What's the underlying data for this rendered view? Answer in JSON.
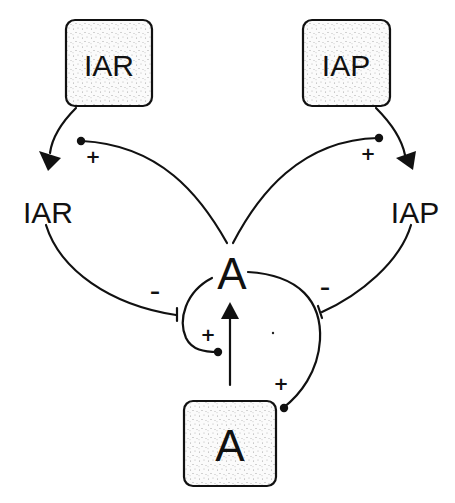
{
  "diagram": {
    "boxes": {
      "iar_source": {
        "label": "IAR"
      },
      "iap_source": {
        "label": "IAP"
      },
      "a_source": {
        "label": "A"
      }
    },
    "nodes": {
      "iar": {
        "label": "IAR"
      },
      "iap": {
        "label": "IAP"
      },
      "a": {
        "label": "A"
      }
    },
    "signs": {
      "a_to_iar": "+",
      "a_to_iap": "+",
      "iar_to_a": "–",
      "iap_to_a": "–",
      "a_box_to_a_left": "+",
      "a_box_to_a_right": "+"
    },
    "colors": {
      "stroke": "#111111",
      "background": "#ffffff",
      "stipple": "#9a9a9a"
    }
  }
}
